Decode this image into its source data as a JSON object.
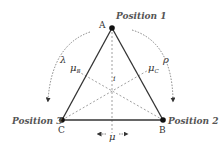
{
  "diagram": {
    "vertices": {
      "A": {
        "label": "A",
        "position_label": "Position 1",
        "x": 112,
        "y": 28
      },
      "B": {
        "label": "B",
        "position_label": "Position 2",
        "x": 163,
        "y": 120
      },
      "C": {
        "label": "C",
        "position_label": "Position 3",
        "x": 62,
        "y": 120
      }
    },
    "center_label": "i",
    "symbols": {
      "lambda": "λ",
      "rho": "ρ",
      "mu": "μ",
      "mu_b": "μ",
      "mu_b_sub": "B",
      "mu_c": "μ",
      "mu_c_sub": "C"
    },
    "colors": {
      "edge": "#333333",
      "dashed": "#888888",
      "label": "#555555",
      "vertex": "#111111"
    }
  }
}
